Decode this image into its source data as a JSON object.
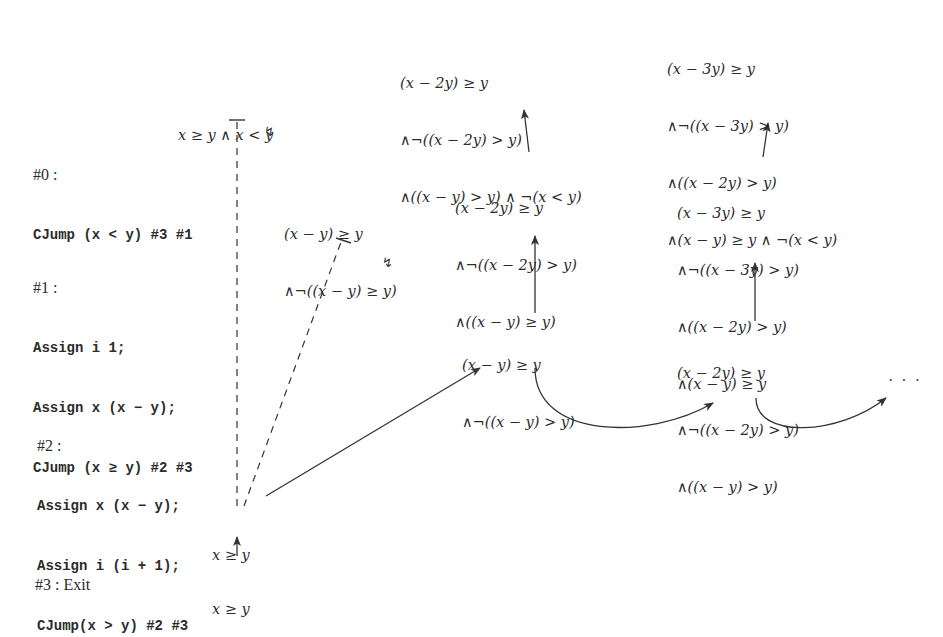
{
  "program": {
    "blocks": [
      {
        "label": "#0 :",
        "lines": [
          "CJump (x < y) #3 #1"
        ]
      },
      {
        "label": "#1 :",
        "lines": [
          "Assign i 1;",
          "Assign x (x − y);",
          "CJump (x ≥ y) #2 #3"
        ]
      },
      {
        "label": "#2 :",
        "lines": [
          "Assign x (x − y);",
          "Assign i (i + 1);",
          "CJump(x > y) #2 #3"
        ]
      },
      {
        "label": "#3 : Exit",
        "lines": []
      }
    ]
  },
  "nodes": {
    "root_bottom": {
      "lines": [
        "x ≥ y"
      ]
    },
    "root": {
      "lines": [
        "x ≥ y"
      ]
    },
    "infeasible_top": {
      "lines": [
        "x ≥ y ∧ x < y"
      ]
    },
    "infeasible_mid": {
      "lines": [
        "(x − y) ≥ y",
        "∧¬((x − y) ≥ y)"
      ]
    },
    "iter1": {
      "lines": [
        "(x − y) ≥ y",
        "∧¬((x − y) > y)"
      ]
    },
    "iter1_up1": {
      "lines": [
        "(x − 2y) ≥ y",
        "∧¬((x − 2y) > y)",
        "∧((x − y) ≥ y)"
      ]
    },
    "iter1_up2": {
      "lines": [
        "(x − 2y) ≥ y",
        "∧¬((x − 2y) > y)",
        "∧((x − y) > y) ∧ ¬(x < y)"
      ]
    },
    "iter2": {
      "lines": [
        "(x − 2y) ≥ y",
        "∧¬((x − 2y) > y)",
        "∧((x − y) > y)"
      ]
    },
    "iter2_up1": {
      "lines": [
        "(x − 3y) ≥ y",
        "∧¬((x − 3y) > y)",
        "∧((x − 2y) > y)",
        "∧(x − y) ≥ y"
      ]
    },
    "iter2_up2": {
      "lines": [
        "(x − 3y) ≥ y",
        "∧¬((x − 3y) > y)",
        "∧((x − 2y) > y)",
        "∧(x − y) ≥ y ∧ ¬(x < y)"
      ]
    },
    "continuation": {
      "text": "· · ·"
    }
  },
  "markers": {
    "infeasible_symbol": "↯"
  },
  "colors": {
    "ink": "#2b2b2b",
    "background": "#ffffff"
  }
}
